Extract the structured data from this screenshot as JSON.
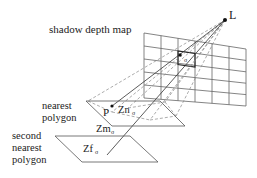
{
  "diagram": {
    "type": "shadow-mapping illustration",
    "labels": {
      "light": "L",
      "depth_map": "shadow depth map",
      "nearest_polygon_line1": "nearest",
      "nearest_polygon_line2": "polygon",
      "second_polygon_line1": "second",
      "second_polygon_line2": "nearest",
      "second_polygon_line3": "polygon",
      "point": "P",
      "zn": "Zn",
      "zm": "Zm",
      "zf": "Zf",
      "sigma": "σ"
    },
    "grid": {
      "columns": 6,
      "rows": 5
    },
    "colors": {
      "line": "#555555",
      "dashed": "#888888",
      "text": "#222222",
      "highlight": "#222222"
    }
  }
}
